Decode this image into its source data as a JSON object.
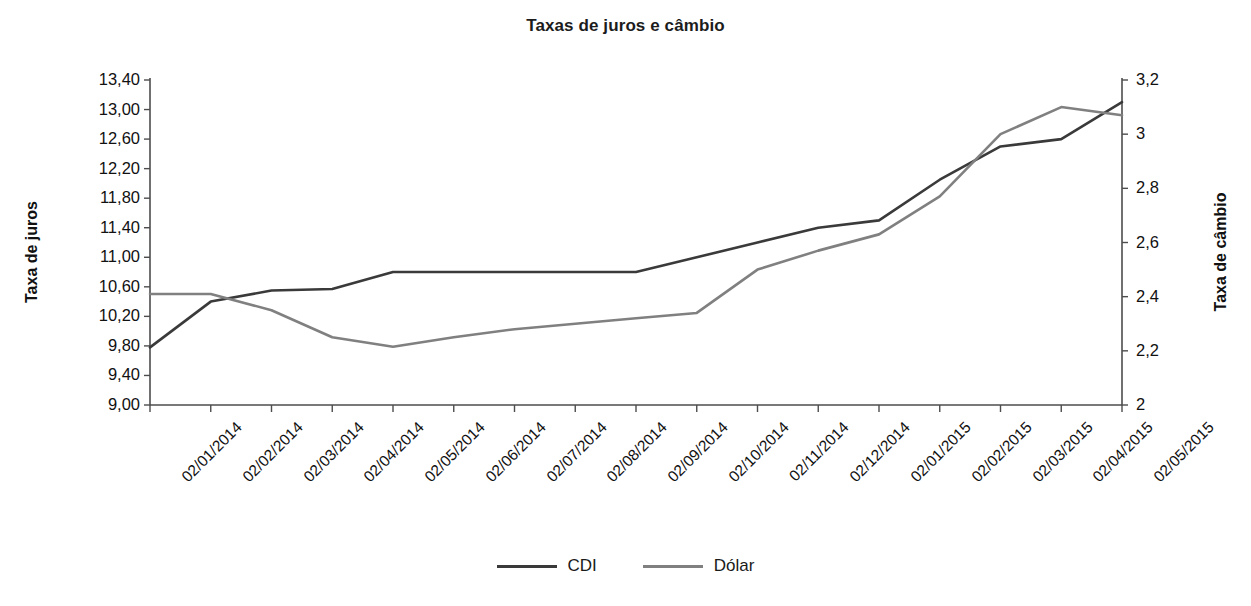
{
  "chart_data": {
    "type": "line",
    "title": "Taxas de juros e câmbio",
    "xlabel": "",
    "ylabel": "Taxa de juros",
    "y2label": "Taxa de câmbio",
    "grid": false,
    "legend_position": "bottom",
    "categories": [
      "02/01/2014",
      "02/02/2014",
      "02/03/2014",
      "02/04/2014",
      "02/05/2014",
      "02/06/2014",
      "02/07/2014",
      "02/08/2014",
      "02/09/2014",
      "02/10/2014",
      "02/11/2014",
      "02/12/2014",
      "02/01/2015",
      "02/02/2015",
      "02/03/2015",
      "02/04/2015",
      "02/05/2015"
    ],
    "ylim": [
      9.0,
      13.4
    ],
    "yticks": [
      "9,00",
      "9,40",
      "9,80",
      "10,20",
      "10,60",
      "11,00",
      "11,40",
      "11,80",
      "12,20",
      "12,60",
      "13,00",
      "13,40"
    ],
    "ytick_values": [
      9.0,
      9.4,
      9.8,
      10.2,
      10.6,
      11.0,
      11.4,
      11.8,
      12.2,
      12.6,
      13.0,
      13.4
    ],
    "y2lim": [
      2.0,
      3.2
    ],
    "y2ticks": [
      "2",
      "2,2",
      "2,4",
      "2,6",
      "2,8",
      "3",
      "3,2"
    ],
    "y2tick_values": [
      2.0,
      2.2,
      2.4,
      2.6,
      2.8,
      3.0,
      3.2
    ],
    "series": [
      {
        "name": "CDI",
        "axis": "left",
        "color": "#3a3a3a",
        "values": [
          9.78,
          10.4,
          10.55,
          10.57,
          10.8,
          10.8,
          10.8,
          10.8,
          10.8,
          11.0,
          11.2,
          11.4,
          11.5,
          12.05,
          12.5,
          12.6,
          13.1
        ]
      },
      {
        "name": "Dólar",
        "axis": "right",
        "color": "#808080",
        "values": [
          2.41,
          2.41,
          2.35,
          2.25,
          2.215,
          2.25,
          2.28,
          2.3,
          2.32,
          2.34,
          2.5,
          2.57,
          2.63,
          2.77,
          3.0,
          3.1,
          3.07
        ]
      }
    ]
  },
  "legend": {
    "items": [
      {
        "label": "CDI",
        "color": "#3a3a3a"
      },
      {
        "label": "Dólar",
        "color": "#808080"
      }
    ]
  }
}
